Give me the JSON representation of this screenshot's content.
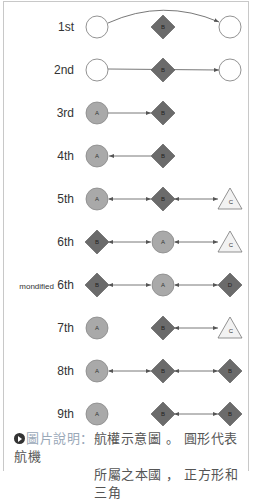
{
  "diagram": {
    "colors": {
      "circle_empty": "#ffffff",
      "circle_a": "#a9a9a9",
      "diamond": "#6b6b6b",
      "triangle": "#f2f2f2",
      "edge": "#555555",
      "border": "#c8c8c8"
    },
    "rows": [
      {
        "label": "1st",
        "y": 27,
        "nodes": [
          {
            "shape": "circle",
            "fill": "empty",
            "x": 97,
            "label": ""
          },
          {
            "shape": "diamond",
            "x": 163,
            "label": "B"
          },
          {
            "shape": "circle",
            "fill": "empty",
            "x": 230,
            "label": ""
          }
        ],
        "edge": "curve 1->3"
      },
      {
        "label": "2nd",
        "y": 70,
        "nodes": [
          {
            "shape": "circle",
            "fill": "empty",
            "x": 97,
            "label": ""
          },
          {
            "shape": "diamond",
            "x": 163,
            "label": "B"
          },
          {
            "shape": "circle",
            "fill": "empty",
            "x": 230,
            "label": ""
          }
        ],
        "edge": "1->3 through B"
      },
      {
        "label": "3rd",
        "y": 113,
        "nodes": [
          {
            "shape": "circle",
            "x": 97,
            "label": "A"
          },
          {
            "shape": "diamond",
            "x": 163,
            "label": "B"
          }
        ],
        "edge": "A->B"
      },
      {
        "label": "4th",
        "y": 156,
        "nodes": [
          {
            "shape": "circle",
            "x": 97,
            "label": "A"
          },
          {
            "shape": "diamond",
            "x": 163,
            "label": "B"
          }
        ],
        "edge": "B->A"
      },
      {
        "label": "5th",
        "y": 199,
        "nodes": [
          {
            "shape": "circle",
            "x": 97,
            "label": "A"
          },
          {
            "shape": "diamond",
            "x": 163,
            "label": "B"
          },
          {
            "shape": "triangle",
            "x": 230,
            "label": "C"
          }
        ],
        "edge": "A<->B<->C"
      },
      {
        "label": "6th",
        "y": 242,
        "nodes": [
          {
            "shape": "diamond",
            "x": 97,
            "label": "B"
          },
          {
            "shape": "circle",
            "x": 163,
            "label": "A"
          },
          {
            "shape": "triangle",
            "x": 230,
            "label": "C"
          }
        ],
        "edge": "B<->A<->C"
      },
      {
        "label_small": "mondified",
        "label": "6th",
        "y": 285,
        "nodes": [
          {
            "shape": "diamond",
            "x": 97,
            "label": "B"
          },
          {
            "shape": "circle",
            "x": 163,
            "label": "A"
          },
          {
            "shape": "diamond",
            "x": 230,
            "label": "D"
          }
        ],
        "edge": "B<->A<->D"
      },
      {
        "label": "7th",
        "y": 328,
        "nodes": [
          {
            "shape": "circle",
            "x": 97,
            "label": "A"
          },
          {
            "shape": "diamond",
            "x": 163,
            "label": "B"
          },
          {
            "shape": "triangle",
            "x": 230,
            "label": "C"
          }
        ],
        "edge": "B<->C"
      },
      {
        "label": "8th",
        "y": 371,
        "nodes": [
          {
            "shape": "circle",
            "x": 97,
            "label": "A"
          },
          {
            "shape": "diamond",
            "x": 163,
            "label": "B"
          },
          {
            "shape": "diamond",
            "x": 230,
            "label": "B"
          }
        ],
        "edge": "A<->B<->B"
      },
      {
        "label": "9th",
        "y": 414,
        "nodes": [
          {
            "shape": "circle",
            "x": 97,
            "label": "A"
          },
          {
            "shape": "diamond",
            "x": 163,
            "label": "B"
          },
          {
            "shape": "diamond",
            "x": 230,
            "label": "B"
          }
        ],
        "edge": "B<->B"
      }
    ]
  },
  "caption": {
    "label": "圖片說明：",
    "line1": "航權示意圖 。 圓形代表航機",
    "line2": "所屬之本國 ， 正方形和三角"
  }
}
